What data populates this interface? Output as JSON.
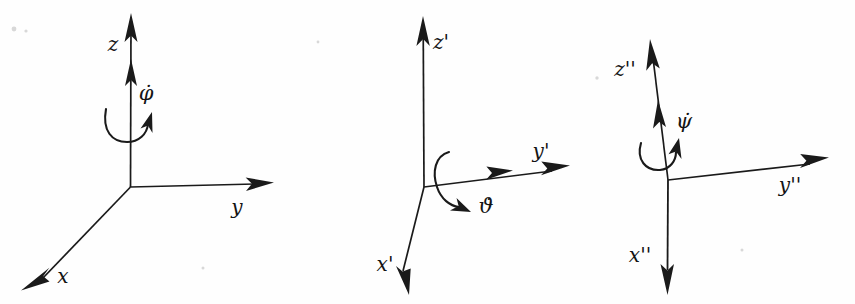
{
  "figure": {
    "background_color": "#fefefe",
    "ink_color": "#1a1a1a",
    "width": 855,
    "height": 304,
    "panel_count": 3
  },
  "panels": [
    {
      "id": "frame-unprimed",
      "name": "first-coordinate-frame",
      "origin": {
        "x": 130,
        "y": 187
      },
      "rate_symbol": "φ̇",
      "rate_label_position": {
        "x": 146,
        "y": 94
      },
      "spin_axis": "z",
      "spin_direction": "counterclockwise-about-z",
      "axes": [
        {
          "name": "z-axis",
          "label": "z",
          "label_position": {
            "x": 113,
            "y": 45
          },
          "tip": {
            "x": 131,
            "y": 14
          },
          "arrowheads": 2,
          "orientation": "vertical-up"
        },
        {
          "name": "y-axis",
          "label": "y",
          "label_position": {
            "x": 237,
            "y": 208
          },
          "tip": {
            "x": 272,
            "y": 182
          },
          "arrowheads": 1,
          "orientation": "horizontal-right"
        },
        {
          "name": "x-axis",
          "label": "x",
          "label_position": {
            "x": 63,
            "y": 277
          },
          "tip": {
            "x": 22,
            "y": 288
          },
          "arrowheads": 1,
          "orientation": "down-left-oblique"
        }
      ]
    },
    {
      "id": "frame-primed",
      "name": "second-coordinate-frame",
      "origin": {
        "x": 424,
        "y": 187
      },
      "rate_symbol": "ϑ̇",
      "rate_label_position": {
        "x": 484,
        "y": 207
      },
      "spin_axis": "x'",
      "spin_direction": "about-x-prime",
      "axes": [
        {
          "name": "z-prime-axis",
          "label": "z'",
          "label_position": {
            "x": 441,
            "y": 43
          },
          "tip": {
            "x": 423,
            "y": 17
          },
          "arrowheads": 1,
          "orientation": "vertical-up"
        },
        {
          "name": "y-prime-axis",
          "label": "y'",
          "label_position": {
            "x": 541,
            "y": 152
          },
          "tip": {
            "x": 568,
            "y": 166
          },
          "arrowheads": 2,
          "orientation": "right-slightly-up"
        },
        {
          "name": "x-prime-axis",
          "label": "x'",
          "label_position": {
            "x": 385,
            "y": 265
          },
          "tip": {
            "x": 408,
            "y": 292
          },
          "arrowheads": 1,
          "orientation": "steeply-down-left"
        }
      ]
    },
    {
      "id": "frame-double-primed",
      "name": "third-coordinate-frame",
      "origin": {
        "x": 668,
        "y": 180
      },
      "rate_symbol": "ψ̇",
      "rate_label_position": {
        "x": 684,
        "y": 122
      },
      "spin_axis": "z''",
      "spin_direction": "about-z-double-prime",
      "axes": [
        {
          "name": "z-double-prime-axis",
          "label": "z''",
          "label_position": {
            "x": 625,
            "y": 70
          },
          "tip": {
            "x": 650,
            "y": 40
          },
          "arrowheads": 2,
          "orientation": "up-tilted-left"
        },
        {
          "name": "y-double-prime-axis",
          "label": "y''",
          "label_position": {
            "x": 790,
            "y": 186
          },
          "tip": {
            "x": 828,
            "y": 158
          },
          "arrowheads": 1,
          "orientation": "right-slightly-up"
        },
        {
          "name": "x-double-prime-axis",
          "label": "x''",
          "label_position": {
            "x": 640,
            "y": 256
          },
          "tip": {
            "x": 667,
            "y": 292
          },
          "arrowheads": 1,
          "orientation": "vertical-down"
        }
      ]
    }
  ]
}
